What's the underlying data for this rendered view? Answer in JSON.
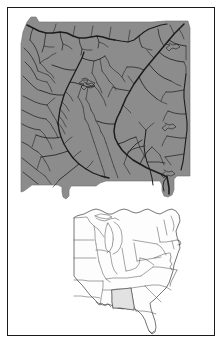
{
  "figure": {
    "name": "alabama-hydrography-map",
    "title": "Alabama rivers and streams with eastern United States locator inset",
    "width": 223,
    "height": 345
  },
  "colors": {
    "background": "#ffffff",
    "frame_border": "#1a1a1a",
    "state_fill": "#8c8c8c",
    "state_outline": "#6e6e6e",
    "river_stroke": "#1c1c1c",
    "inset_fill": "#fdfdfd",
    "inset_stroke": "#4a4a4a",
    "inset_highlight_fill": "#e2e2e2"
  },
  "main_map": {
    "name": "alabama-state-map",
    "subject": "Alabama",
    "fill_label": "solid gray state polygon",
    "overlay_label": "dendritic stream and river network",
    "river_count_label": "dense stream network"
  },
  "inset_map": {
    "name": "eastern-us-locator-inset",
    "subject": "Eastern United States",
    "highlight_state": "Alabama",
    "states": [
      "Minnesota",
      "Wisconsin",
      "Michigan",
      "Iowa",
      "Illinois",
      "Indiana",
      "Ohio",
      "Missouri",
      "Kentucky",
      "Tennessee",
      "Arkansas",
      "Louisiana",
      "Mississippi",
      "Alabama",
      "Georgia",
      "Florida",
      "South Carolina",
      "North Carolina",
      "Virginia",
      "West Virginia",
      "Maryland",
      "Delaware",
      "Pennsylvania",
      "New Jersey",
      "New York",
      "Connecticut",
      "Rhode Island",
      "Massachusetts",
      "Vermont",
      "New Hampshire",
      "Maine"
    ]
  },
  "geometry": {
    "state_outline_path": "M29,21 L34,20 L40,20 L44,22 L52,22 L63,22 L78,22 L96,22 L112,22 L130,22 L147,22 L160,22 L170,21 L183,21 L190,27 L190,34 L190,46 L190,62 L190,80 L190,96 L190,112 L190,128 L190,143 L190,156 L190,168 L190,176 L184,176 L176,176 L172,180 L172,186 L172,192 L168,196 L163,196 L160,192 L160,186 L157,182 L152,182 L146,182 L140,182 L133,182 L126,182 L120,182 L114,182 L108,182 L102,182 L97,186 L92,186 L86,186 L80,186 L74,186 L70,190 L70,196 L66,198 L62,196 L62,190 L58,186 L52,186 L46,186 L40,186 L34,186 L30,190 L26,192 L22,192 L22,186 L22,176 L22,162 L22,148 L22,132 L22,116 L22,100 L22,84 L22,68 L22,52 L22,38 L25,28 Z",
    "inset_bbox": [
      68,
      203,
      112,
      128
    ]
  },
  "labels": {
    "none_visible": ""
  }
}
